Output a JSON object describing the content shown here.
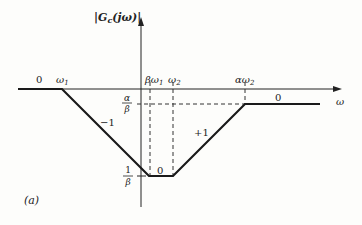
{
  "figure": {
    "panel_label": "(a)",
    "y_axis_label": "|G",
    "y_axis_label_sub": "c",
    "y_axis_label_tail": "(jω)|",
    "x_axis_label": "ω",
    "breakpoints": {
      "w1": "ω",
      "w1_sub": "1",
      "bw1": "βω",
      "bw1_sub": "1",
      "w2": "ω",
      "w2_sub": "2",
      "aw2": "αω",
      "aw2_sub": "2"
    },
    "magnitude_ticks": {
      "upper_num": "α",
      "upper_den": "β",
      "lower_num": "1",
      "lower_den": "β"
    },
    "slopes": {
      "left_flat": "0",
      "descending": "−1",
      "bottom_flat": "0",
      "ascending": "+1",
      "right_flat": "0"
    },
    "colors": {
      "line": "#1a1a1a",
      "background": "#fdfdfb"
    }
  }
}
